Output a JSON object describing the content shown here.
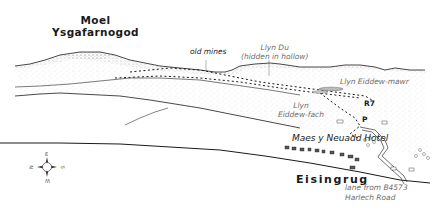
{
  "map": {
    "title_peak": {
      "line1": "Moel",
      "line2": "Ysgafarnogod"
    },
    "labels": {
      "old_mines": "old mines",
      "llyn_du_line1": "Llyn Du",
      "llyn_du_line2": "(hidden in hollow)",
      "llyn_eiddew_mawr": "Llyn Eiddew-mawr",
      "llyn_eiddew_fach_line1": "Llyn",
      "llyn_eiddew_fach_line2": "Eiddew-fach",
      "route": "R7",
      "parking": "P",
      "hotel": "Maes y Neuadd Hotel",
      "village": "Eisingrug",
      "lane_line1": "lane from B4573",
      "lane_line2": "Harlech Road"
    },
    "compass": {
      "left": "N",
      "top": "E",
      "right": "S",
      "bottom": "W"
    },
    "colors": {
      "ink": "#1a1a1a",
      "label_grey": "#6d6d6d",
      "stipple": "#9a9a9a",
      "background": "#ffffff"
    }
  }
}
